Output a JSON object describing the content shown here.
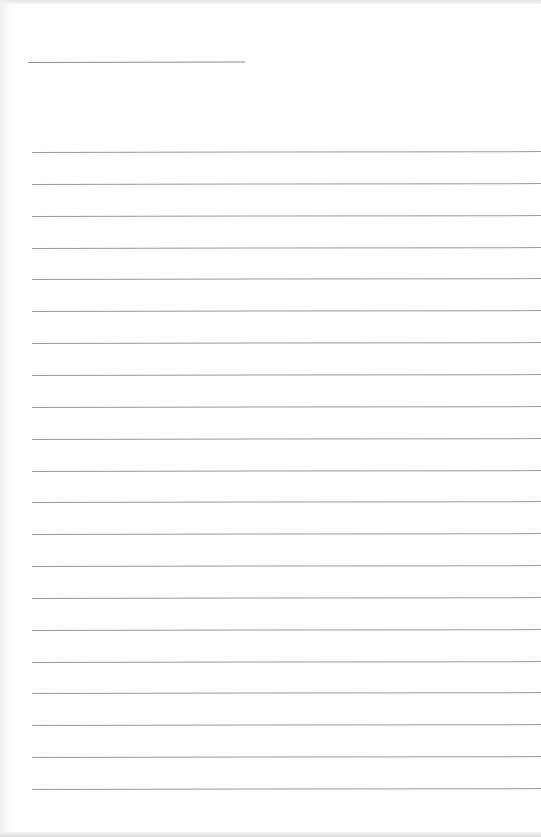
{
  "page": {
    "type": "blank lined paper",
    "background_color": "#fefefe",
    "line_color": "#9a9a9a"
  },
  "title_line": {
    "x": 28,
    "y": 62,
    "width": 217
  },
  "ruled_lines": {
    "count": 21,
    "x": 32,
    "width": 509,
    "first_y": 152,
    "spacing": 31.85
  }
}
